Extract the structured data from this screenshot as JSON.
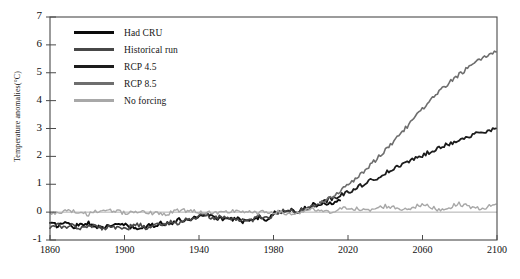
{
  "chart_data": {
    "type": "line",
    "title": "",
    "xlabel": "",
    "ylabel": "Temperature anomalies(°C)",
    "xlim": [
      1860,
      2100
    ],
    "ylim": [
      -1,
      7
    ],
    "xticks": [
      1860,
      1900,
      1940,
      1980,
      2020,
      2060,
      2100
    ],
    "yticks": [
      -1,
      0,
      1,
      2,
      3,
      4,
      5,
      6,
      7
    ],
    "grid": false,
    "legend_position": "upper-left-inside",
    "zero_reference_line": 0,
    "series": [
      {
        "name": "Had CRU",
        "color": "#0b0b0b",
        "width": 1.9,
        "x": [
          1860,
          1864,
          1868,
          1872,
          1876,
          1880,
          1884,
          1888,
          1892,
          1896,
          1900,
          1904,
          1908,
          1912,
          1916,
          1920,
          1924,
          1928,
          1932,
          1936,
          1940,
          1944,
          1948,
          1952,
          1956,
          1960,
          1964,
          1968,
          1972,
          1976,
          1980,
          1984,
          1988,
          1992,
          1996,
          2000,
          2004,
          2008,
          2012,
          2016
        ],
        "values": [
          -0.42,
          -0.48,
          -0.36,
          -0.52,
          -0.44,
          -0.38,
          -0.55,
          -0.46,
          -0.58,
          -0.4,
          -0.47,
          -0.56,
          -0.6,
          -0.52,
          -0.46,
          -0.38,
          -0.42,
          -0.3,
          -0.28,
          -0.24,
          -0.12,
          -0.06,
          -0.18,
          -0.22,
          -0.3,
          -0.2,
          -0.34,
          -0.22,
          -0.18,
          -0.28,
          -0.06,
          0.02,
          0.08,
          0.02,
          0.12,
          0.22,
          0.3,
          0.28,
          0.36,
          0.48
        ]
      },
      {
        "name": "Historical run",
        "color": "#474747",
        "width": 1.6,
        "x": [
          1860,
          1864,
          1868,
          1872,
          1876,
          1880,
          1884,
          1888,
          1892,
          1896,
          1900,
          1904,
          1908,
          1912,
          1916,
          1920,
          1924,
          1928,
          1932,
          1936,
          1940,
          1944,
          1948,
          1952,
          1956,
          1960,
          1964,
          1968,
          1972,
          1976,
          1980,
          1984,
          1988,
          1992,
          1996,
          2000,
          2004
        ],
        "values": [
          -0.5,
          -0.4,
          -0.56,
          -0.44,
          -0.62,
          -0.5,
          -0.44,
          -0.6,
          -0.48,
          -0.56,
          -0.62,
          -0.5,
          -0.44,
          -0.58,
          -0.5,
          -0.44,
          -0.36,
          -0.4,
          -0.3,
          -0.2,
          -0.16,
          -0.1,
          -0.22,
          -0.16,
          -0.26,
          -0.32,
          -0.24,
          -0.3,
          -0.16,
          -0.22,
          -0.1,
          0.0,
          0.06,
          -0.04,
          0.1,
          0.18,
          0.26
        ]
      },
      {
        "name": "RCP 4.5",
        "color": "#1c1c1c",
        "width": 1.8,
        "x": [
          2005,
          2010,
          2015,
          2020,
          2025,
          2030,
          2035,
          2040,
          2045,
          2050,
          2055,
          2060,
          2065,
          2070,
          2075,
          2080,
          2085,
          2090,
          2095,
          2100
        ],
        "values": [
          0.32,
          0.46,
          0.58,
          0.72,
          0.9,
          1.05,
          1.22,
          1.4,
          1.56,
          1.72,
          1.9,
          2.04,
          2.2,
          2.34,
          2.48,
          2.6,
          2.72,
          2.82,
          2.9,
          2.98
        ]
      },
      {
        "name": "RCP 8.5",
        "color": "#6e6e6e",
        "width": 1.6,
        "x": [
          2005,
          2010,
          2015,
          2020,
          2025,
          2030,
          2035,
          2040,
          2045,
          2050,
          2055,
          2060,
          2065,
          2070,
          2075,
          2080,
          2085,
          2090,
          2095,
          2100
        ],
        "values": [
          0.34,
          0.52,
          0.72,
          0.95,
          1.25,
          1.55,
          1.88,
          2.22,
          2.58,
          2.95,
          3.32,
          3.7,
          4.05,
          4.38,
          4.68,
          4.96,
          5.2,
          5.42,
          5.62,
          5.8
        ]
      },
      {
        "name": "No forcing",
        "color": "#a8a8a8",
        "width": 1.4,
        "x": [
          1860,
          1870,
          1880,
          1890,
          1900,
          1910,
          1920,
          1930,
          1940,
          1950,
          1960,
          1970,
          1980,
          1990,
          2000,
          2010,
          2020,
          2030,
          2040,
          2050,
          2060,
          2070,
          2080,
          2090,
          2100
        ],
        "values": [
          -0.05,
          0.06,
          -0.08,
          0.1,
          -0.02,
          0.04,
          -0.1,
          0.08,
          0.02,
          -0.06,
          0.06,
          -0.04,
          0.02,
          -0.08,
          0.1,
          -0.02,
          0.18,
          0.04,
          0.22,
          0.1,
          0.26,
          0.08,
          0.3,
          0.12,
          0.26
        ]
      }
    ]
  },
  "axis": {
    "ylabel": "Temperature anomalies(°C)",
    "yticks": [
      "7",
      "6",
      "5",
      "4",
      "3",
      "2",
      "1",
      "0",
      "-1"
    ],
    "xticks": [
      "1860",
      "1900",
      "1940",
      "1980",
      "2020",
      "2060",
      "2100"
    ]
  },
  "legend": {
    "items": [
      {
        "label": "Had CRU",
        "color": "#0b0b0b"
      },
      {
        "label": "Historical run",
        "color": "#474747"
      },
      {
        "label": "RCP 4.5",
        "color": "#1c1c1c"
      },
      {
        "label": "RCP 8.5",
        "color": "#6e6e6e"
      },
      {
        "label": "No forcing",
        "color": "#a8a8a8"
      }
    ]
  },
  "footnote": {
    "text": ""
  }
}
